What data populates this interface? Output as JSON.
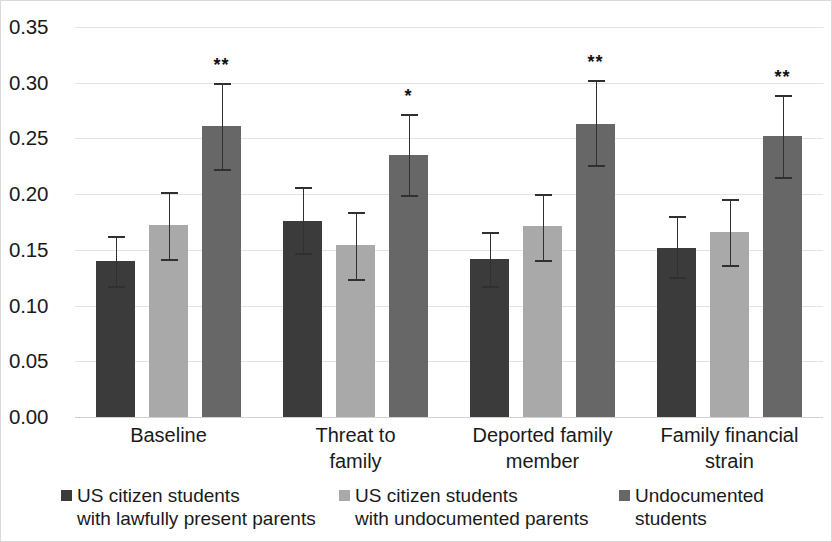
{
  "chart_data": {
    "type": "bar",
    "title": "",
    "subtitle": "",
    "xlabel": "",
    "ylabel": "",
    "ylim": [
      0.0,
      0.35
    ],
    "ytick_labels": [
      "0.35",
      "0.30",
      "0.25",
      "0.20",
      "0.15",
      "0.10",
      "0.05",
      "0.00"
    ],
    "ytick_values": [
      0.35,
      0.3,
      0.25,
      0.2,
      0.15,
      0.1,
      0.05,
      0.0
    ],
    "grid": true,
    "legend_position": "bottom",
    "categories": [
      "Baseline",
      "Threat to\nfamily",
      "Deported family\nmember",
      "Family financial\nstrain"
    ],
    "series": [
      {
        "name": "US citizen students\nwith lawfully present parents",
        "color": "#3b3b3b",
        "values": [
          0.14,
          0.176,
          0.142,
          0.152
        ],
        "err_low": [
          0.118,
          0.147,
          0.118,
          0.126
        ],
        "err_high": [
          0.162,
          0.206,
          0.166,
          0.18
        ],
        "sig": [
          "",
          "",
          "",
          ""
        ]
      },
      {
        "name": "US citizen students\nwith undocumented parents",
        "color": "#a9a9a9",
        "values": [
          0.172,
          0.154,
          0.171,
          0.166
        ],
        "err_low": [
          0.142,
          0.124,
          0.141,
          0.136
        ],
        "err_high": [
          0.202,
          0.184,
          0.2,
          0.196
        ],
        "sig": [
          "",
          "",
          "",
          ""
        ]
      },
      {
        "name": "Undocumented\nstudents",
        "color": "#676767",
        "values": [
          0.261,
          0.235,
          0.263,
          0.252
        ],
        "err_low": [
          0.223,
          0.199,
          0.226,
          0.215
        ],
        "err_high": [
          0.3,
          0.272,
          0.302,
          0.289
        ],
        "sig": [
          "**",
          "*",
          "**",
          "**"
        ]
      }
    ]
  },
  "legend": {
    "items": [
      {
        "label": "US citizen students\nwith lawfully present parents",
        "color": "#3b3b3b"
      },
      {
        "label": "US citizen students\nwith undocumented parents",
        "color": "#a9a9a9"
      },
      {
        "label": "Undocumented\nstudents",
        "color": "#676767"
      }
    ]
  }
}
